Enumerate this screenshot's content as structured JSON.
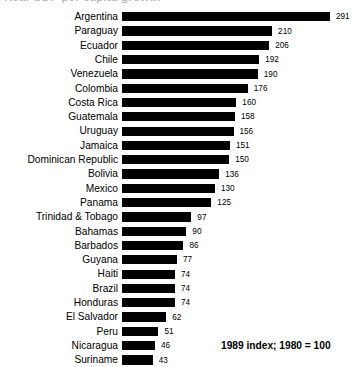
{
  "chart_data": {
    "type": "bar",
    "orientation": "horizontal",
    "title": "Real GDP per capita growth",
    "subtitle": "",
    "xlabel": "",
    "ylabel": "",
    "note": "1989 index; 1980 = 100",
    "grid": false,
    "legend": null,
    "xlim": [
      0,
      291
    ],
    "categories": [
      "Argentina",
      "Paraguay",
      "Ecuador",
      "Chile",
      "Venezuela",
      "Colombia",
      "Costa Rica",
      "Guatemala",
      "Uruguay",
      "Jamaica",
      "Dominican Republic",
      "Bolivia",
      "Mexico",
      "Panama",
      "Trinidad & Tobago",
      "Bahamas",
      "Barbados",
      "Guyana",
      "Haiti",
      "Brazil",
      "Honduras",
      "El Salvador",
      "Peru",
      "Nicaragua",
      "Suriname"
    ],
    "values": [
      291,
      210,
      206,
      192,
      190,
      176,
      160,
      158,
      156,
      151,
      150,
      136,
      130,
      125,
      97,
      90,
      86,
      77,
      74,
      74,
      74,
      62,
      51,
      46,
      43
    ],
    "bar_color": "#000000",
    "background_color": "#ffffff"
  },
  "footnote": "1989 index; 1980 = 100"
}
